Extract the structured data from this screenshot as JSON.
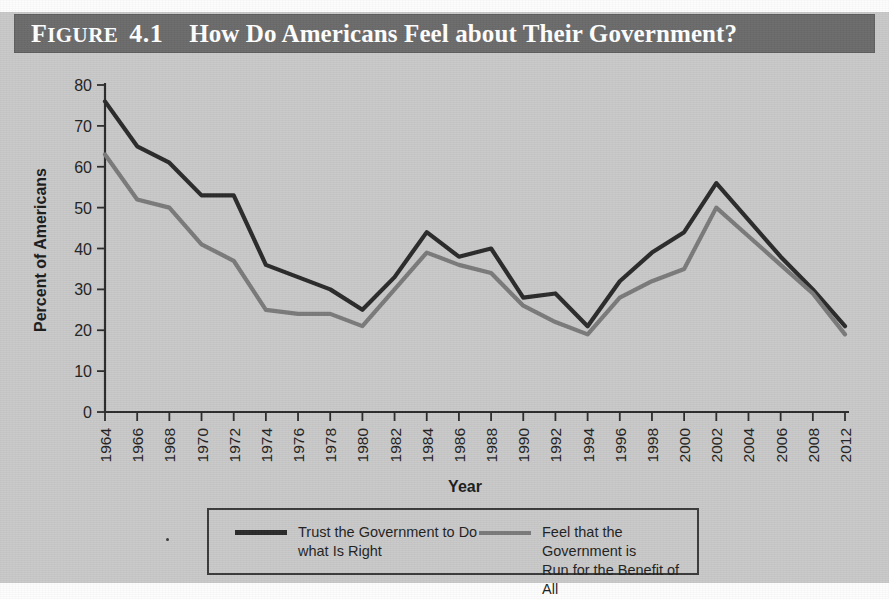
{
  "figure": {
    "label_prefix": "Figure",
    "label_prefix_cap": "F",
    "label_prefix_rest": "IGURE",
    "number": "4.1",
    "title": "How Do Americans Feel about Their Government?",
    "banner_color": "#6b6b6b",
    "page_background": "#c9c9c9"
  },
  "legend": {
    "entries": [
      {
        "name": "trust",
        "label": "Trust the Government to Do\nwhat Is Right",
        "color": "#2a2a2a"
      },
      {
        "name": "benefit",
        "label": "Feel that the Government is\nRun for the Benefit of All",
        "color": "#7a7a7a"
      }
    ]
  },
  "chart_data": {
    "type": "line",
    "title": "How Do Americans Feel about Their Government?",
    "xlabel": "Year",
    "ylabel": "Percent of Americans",
    "ylim": [
      0,
      80
    ],
    "ytick_step": 10,
    "yticks": [
      0,
      10,
      20,
      30,
      40,
      50,
      60,
      70,
      80
    ],
    "grid": false,
    "legend_position": "below",
    "categories": [
      "1964",
      "1966",
      "1968",
      "1970",
      "1972",
      "1974",
      "1976",
      "1978",
      "1980",
      "1982",
      "1984",
      "1986",
      "1988",
      "1990",
      "1992",
      "1994",
      "1996",
      "1998",
      "2000",
      "2002",
      "2004",
      "2006",
      "2008",
      "2012"
    ],
    "series": [
      {
        "name": "Trust the Government to Do what Is Right",
        "color": "#2a2a2a",
        "values": [
          76,
          65,
          61,
          53,
          53,
          36,
          33,
          30,
          25,
          33,
          44,
          38,
          40,
          28,
          29,
          21,
          32,
          39,
          44,
          56,
          47,
          38,
          30,
          21
        ]
      },
      {
        "name": "Feel that the Government is Run for the Benefit of All",
        "color": "#7a7a7a",
        "values": [
          63,
          52,
          50,
          41,
          37,
          25,
          24,
          24,
          21,
          30,
          39,
          36,
          34,
          26,
          22,
          19,
          28,
          32,
          35,
          50,
          43,
          36,
          29,
          19
        ]
      }
    ]
  }
}
